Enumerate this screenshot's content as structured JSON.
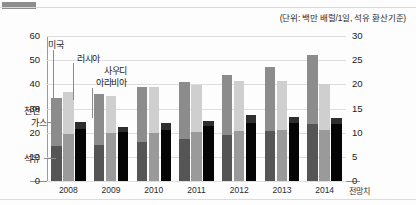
{
  "unit_note": "(단위: 백만 배럴/1일, 석유 환산기준)",
  "axis": {
    "left_ticks": [
      "60",
      "50",
      "40",
      "30",
      "20",
      "10",
      "0"
    ],
    "right_ticks": [
      "30",
      "25",
      "20",
      "15",
      "10",
      "5",
      "0"
    ],
    "forecast_label": "전망치"
  },
  "annotations": {
    "us": "미국",
    "russia": "러시아",
    "saudi_line1": "사우디",
    "saudi_line2": "아라비아",
    "gas_line1": "천연",
    "gas_line2": "가스",
    "oil": "석유"
  },
  "colors": {
    "us": "#8c8c8c",
    "russia": "#cfcfcf",
    "saudi": "#111111",
    "us_oil": "#555555",
    "russia_oil": "#9a9a9a",
    "saudi_oil": "#050505",
    "grid": "#dedede",
    "axis": "#8f8f8f"
  },
  "chart_data": {
    "type": "bar",
    "title": "",
    "subtitle": "",
    "xlabel": "",
    "ylabel": "",
    "unit": "백만 배럴/1일, 석유 환산기준",
    "stacked": true,
    "grouped": true,
    "categories": [
      "2008",
      "2009",
      "2010",
      "2011",
      "2012",
      "2013",
      "2014"
    ],
    "ylim_left": [
      0,
      60
    ],
    "ylim_right": [
      0,
      30
    ],
    "ytick_step_left": 10,
    "ytick_step_right": 5,
    "grid": true,
    "legend_position": "inline-annotation",
    "series": [
      {
        "name": "미국",
        "color": "#8c8c8c",
        "segments": [
          {
            "name": "석유",
            "color": "#555555",
            "values": [
              7.3,
              7.5,
              8.0,
              8.6,
              9.5,
              10.4,
              11.7
            ]
          },
          {
            "name": "천연가스",
            "color": "#8c8c8c",
            "values": [
              9.8,
              10.5,
              11.5,
              11.8,
              12.5,
              13.2,
              14.4
            ]
          }
        ],
        "totals": [
          17.1,
          18.0,
          19.5,
          20.4,
          22.0,
          23.6,
          26.1
        ]
      },
      {
        "name": "러시아",
        "color": "#cfcfcf",
        "segments": [
          {
            "name": "석유",
            "color": "#9a9a9a",
            "values": [
              9.8,
              9.9,
              10.0,
              10.2,
              10.4,
              10.5,
              10.6
            ]
          },
          {
            "name": "천연가스",
            "color": "#cfcfcf",
            "values": [
              8.6,
              7.6,
              9.4,
              9.6,
              10.2,
              10.1,
              9.5
            ]
          }
        ],
        "totals": [
          18.4,
          17.5,
          19.4,
          19.8,
          20.6,
          20.6,
          20.1
        ]
      },
      {
        "name": "사우디아라비아",
        "color": "#111111",
        "segments": [
          {
            "name": "석유",
            "color": "#050505",
            "values": [
              10.8,
              10.1,
              10.5,
              11.3,
              12.1,
              11.9,
              11.8
            ]
          },
          {
            "name": "천연가스",
            "color": "#2e2e2e",
            "values": [
              1.4,
              1.0,
              1.4,
              1.2,
              1.5,
              1.3,
              1.3
            ]
          }
        ],
        "totals": [
          12.2,
          11.1,
          11.9,
          12.5,
          13.6,
          13.2,
          13.1
        ]
      }
    ]
  }
}
